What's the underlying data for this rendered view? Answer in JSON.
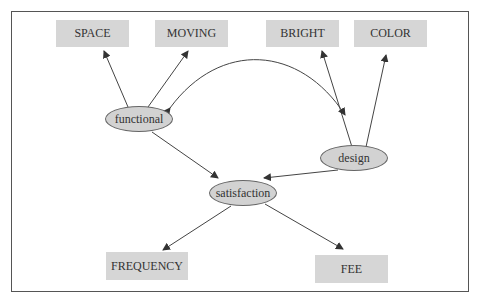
{
  "diagram": {
    "type": "path-model",
    "latent_nodes": [
      {
        "id": "functional",
        "label": "functional"
      },
      {
        "id": "design",
        "label": "design"
      },
      {
        "id": "satisfaction",
        "label": "satisfaction"
      }
    ],
    "observed_nodes": [
      {
        "id": "space",
        "label": "SPACE"
      },
      {
        "id": "moving",
        "label": "MOVING"
      },
      {
        "id": "bright",
        "label": "BRIGHT"
      },
      {
        "id": "color",
        "label": "COLOR"
      },
      {
        "id": "frequency",
        "label": "FREQUENCY"
      },
      {
        "id": "fee",
        "label": "FEE"
      }
    ],
    "edges": [
      {
        "from": "functional",
        "to": "SPACE"
      },
      {
        "from": "functional",
        "to": "MOVING"
      },
      {
        "from": "design",
        "to": "BRIGHT"
      },
      {
        "from": "design",
        "to": "COLOR"
      },
      {
        "from": "functional",
        "to": "design",
        "bidirectional": true
      },
      {
        "from": "functional",
        "to": "satisfaction"
      },
      {
        "from": "design",
        "to": "satisfaction"
      },
      {
        "from": "satisfaction",
        "to": "FREQUENCY"
      },
      {
        "from": "satisfaction",
        "to": "FEE"
      }
    ],
    "colors": {
      "node_fill": "#d6d6d6",
      "stroke": "#555555"
    }
  }
}
